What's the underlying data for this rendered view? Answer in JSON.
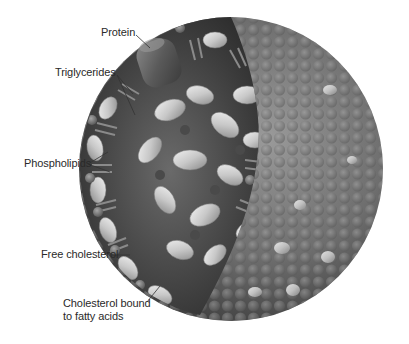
{
  "diagram": {
    "labels": {
      "protein": "Protein",
      "triglycerides": "Triglycerides",
      "phospholipids": "Phospholipids",
      "free_cholesterol": "Free cholesterol",
      "cholesterol_bound_line1": "Cholesterol bound",
      "cholesterol_bound_line2": "to fatty acids"
    },
    "colors": {
      "background": "#ffffff",
      "sphere_dark": "#4a4a4a",
      "sphere_mid": "#7a7a7a",
      "sphere_light": "#a8a8a8",
      "capsule_light": "#d8d8d8",
      "core_dark": "#2e2e2e",
      "leader_line": "#333333",
      "text": "#2a2a2a"
    }
  }
}
